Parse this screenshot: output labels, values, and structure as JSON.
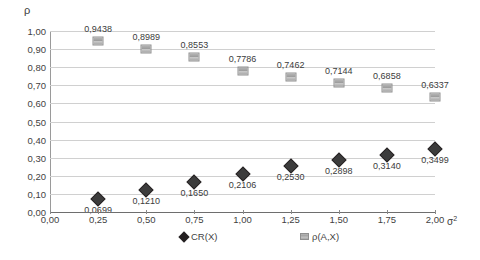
{
  "chart_data": {
    "type": "scatter",
    "title": "",
    "xlabel": "σ²",
    "ylabel": "ρ",
    "xlim": [
      0.0,
      2.0
    ],
    "ylim": [
      0.0,
      1.0
    ],
    "grid": true,
    "legend_position": "bottom",
    "x_ticks": [
      "0,00",
      "0,25",
      "0,50",
      "0,75",
      "1,00",
      "1,25",
      "1,50",
      "1,75",
      "2,00"
    ],
    "x_tick_values": [
      0.0,
      0.25,
      0.5,
      0.75,
      1.0,
      1.25,
      1.5,
      1.75,
      2.0
    ],
    "y_ticks": [
      "0,00",
      "0,10",
      "0,20",
      "0,30",
      "0,40",
      "0,50",
      "0,60",
      "0,70",
      "0,80",
      "0,90",
      "1,00"
    ],
    "y_tick_values": [
      0.0,
      0.1,
      0.2,
      0.3,
      0.4,
      0.5,
      0.6,
      0.7,
      0.8,
      0.9,
      1.0
    ],
    "x": [
      0.25,
      0.5,
      0.75,
      1.0,
      1.25,
      1.5,
      1.75,
      2.0
    ],
    "series": [
      {
        "name": "CR(X)",
        "marker": "diamond",
        "color": "#231f20",
        "values": [
          0.0699,
          0.121,
          0.165,
          0.2106,
          0.253,
          0.2898,
          0.314,
          0.3499
        ],
        "labels": [
          "0,0699",
          "0,1210",
          "0,1650",
          "0,2106",
          "0,2530",
          "0,2898",
          "0,3140",
          "0,3499"
        ],
        "label_position": "below"
      },
      {
        "name": "ρ(A,X)",
        "marker": "square",
        "color": "#a8a8a8",
        "values": [
          0.9438,
          0.8989,
          0.8553,
          0.7786,
          0.7462,
          0.7144,
          0.6858,
          0.6337
        ],
        "labels": [
          "0,9438",
          "0,8989",
          "0,8553",
          "0,7786",
          "0,7462",
          "0,7144",
          "0,6858",
          "0,6337"
        ],
        "label_position": "above"
      }
    ]
  },
  "legend": {
    "items": [
      {
        "label": "CR(X)",
        "marker": "diamond"
      },
      {
        "label": "ρ(A,X)",
        "marker": "square"
      }
    ]
  }
}
